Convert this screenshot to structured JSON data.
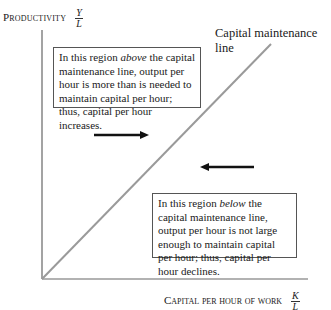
{
  "diagram": {
    "y_axis": {
      "label": "Productivity",
      "fraction": {
        "numerator": "Y",
        "denominator": "L"
      }
    },
    "x_axis": {
      "label": "Capital per hour of work",
      "fraction": {
        "numerator": "K",
        "denominator": "L"
      }
    },
    "line_label": "Capital maintenance line",
    "box_above": {
      "pre": "In this region ",
      "emph": "above",
      "post": " the capital maintenance line, output per hour is more than is needed to maintain capital per hour; thus, capital per hour increases."
    },
    "box_below": {
      "pre": "In this region ",
      "emph": "below",
      "post": " the capital maintenance line, output per hour is not large enough to maintain capital per hour; thus, capital per hour declines."
    },
    "arrows": [
      {
        "direction": "right",
        "meaning": "capital per hour increases"
      },
      {
        "direction": "left",
        "meaning": "capital per hour declines"
      }
    ],
    "colors": {
      "axis": "#666666",
      "line": "#9a9a9a",
      "arrow": "#111111"
    }
  }
}
